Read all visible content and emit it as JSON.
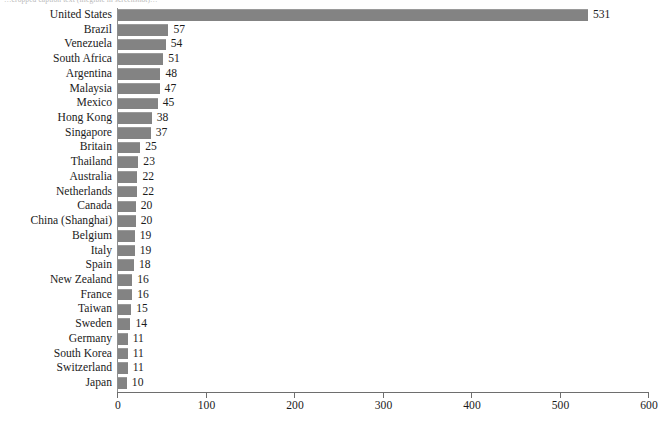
{
  "caption_fragment": "…cropped caption text (illegible in screenshot)…",
  "chart_data": {
    "type": "bar",
    "orientation": "horizontal",
    "title": "",
    "xlabel": "",
    "ylabel": "",
    "xlim": [
      0,
      600
    ],
    "xticks": [
      0,
      100,
      200,
      300,
      400,
      500,
      600
    ],
    "grid": false,
    "legend": false,
    "bar_color": "#838383",
    "categories": [
      "United States",
      "Brazil",
      "Venezuela",
      "South Africa",
      "Argentina",
      "Malaysia",
      "Mexico",
      "Hong Kong",
      "Singapore",
      "Britain",
      "Thailand",
      "Australia",
      "Netherlands",
      "Canada",
      "China (Shanghai)",
      "Belgium",
      "Italy",
      "Spain",
      "New Zealand",
      "France",
      "Taiwan",
      "Sweden",
      "Germany",
      "South Korea",
      "Switzerland",
      "Japan"
    ],
    "values": [
      531,
      57,
      54,
      51,
      48,
      47,
      45,
      38,
      37,
      25,
      23,
      22,
      22,
      20,
      20,
      19,
      19,
      18,
      16,
      16,
      15,
      14,
      11,
      11,
      11,
      10
    ],
    "data_labels": [
      "531",
      "57",
      "54",
      "51",
      "48",
      "47",
      "45",
      "38",
      "37",
      "25",
      "23",
      "22",
      "22",
      "20",
      "20",
      "19",
      "19",
      "18",
      "16",
      "16",
      "15",
      "14",
      "11",
      "11",
      "11",
      "10"
    ]
  }
}
